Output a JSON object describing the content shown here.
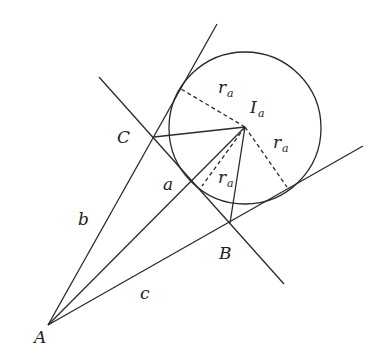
{
  "diagram": {
    "points": {
      "A": {
        "label": "A",
        "x": 48,
        "y": 325
      },
      "B": {
        "label": "B",
        "x": 230,
        "y": 223
      },
      "C": {
        "label": "C",
        "x": 154,
        "y": 137
      },
      "Ia": {
        "label": "I",
        "sub": "a",
        "x": 245,
        "y": 127
      }
    },
    "circle": {
      "cx": 245,
      "cy": 128,
      "r": 76
    },
    "sides": {
      "a": "a",
      "b": "b",
      "c": "c"
    },
    "radius_label": {
      "main": "r",
      "sub": "a"
    },
    "stroke_color": "#2a2a2a"
  }
}
